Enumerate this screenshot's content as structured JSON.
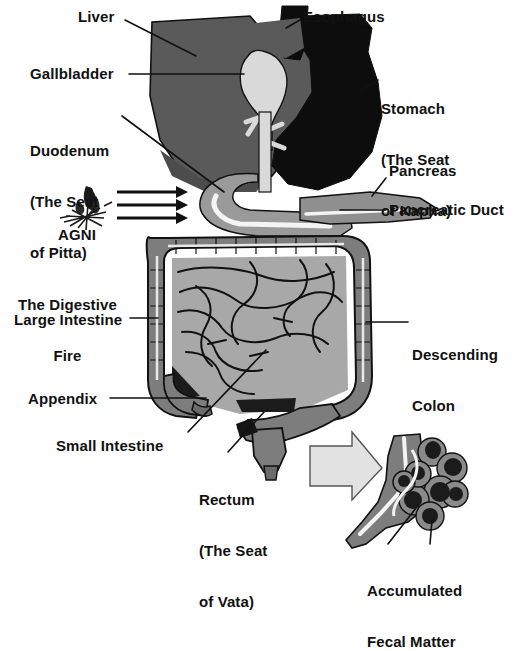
{
  "figure": {
    "background_color": "#ffffff",
    "width": 526,
    "height": 591
  },
  "palette": {
    "stomach_black": "#0d0d0d",
    "liver_dark_gray": "#5a5a5a",
    "colon_mid_gray": "#7d7d7d",
    "small_intestine_gray": "#a8a8a8",
    "duodenum_gray": "#9a9a9a",
    "gallbladder_light": "#d9d9d9",
    "duct_white": "#f4f4f4",
    "arrow_fill": "#e2e2e2",
    "outline": "#111111",
    "text": "#111111"
  },
  "labels": {
    "liver": "Liver",
    "esophagus": "Esophagus",
    "gallbladder": "Gallbladder",
    "stomach_line1": "Stomach",
    "stomach_line2": "(The Seat",
    "stomach_line3": "of Kapha)",
    "duodenum_line1": "Duodenum",
    "duodenum_line2": "(The Seat",
    "duodenum_line3": "of Pitta)",
    "pancreas": "Pancreas",
    "pancreatic_duct": "Pancreatic Duct",
    "agni": "AGNI",
    "digestive_fire_line1": "The Digestive",
    "digestive_fire_line2": "Fire",
    "large_intestine": "Large Intestine",
    "descending_colon_line1": "Descending",
    "descending_colon_line2": "Colon",
    "appendix": "Appendix",
    "small_intestine": "Small Intestine",
    "rectum_line1": "Rectum",
    "rectum_line2": "(The Seat",
    "rectum_line3": "of Vata)",
    "accumulated_line1": "Accumulated",
    "accumulated_line2": "Fecal Matter"
  },
  "icons": {
    "flame": "agni-flame-icon",
    "heat_arrows": "heat-arrow-icon",
    "zoom_arrow": "inset-pointer-arrow-icon"
  },
  "annotations": {
    "heat_arrow_count": 3,
    "inset_name": "accumulated-fecal-matter-inset"
  }
}
